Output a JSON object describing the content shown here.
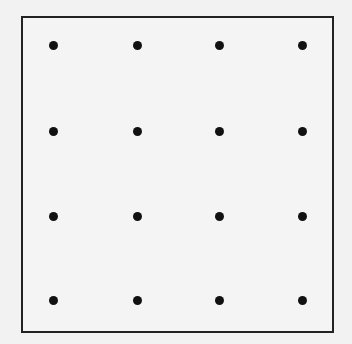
{
  "diagram": {
    "type": "dot-grid",
    "rows": 4,
    "columns": 4,
    "frame": {
      "left": 21,
      "top": 16,
      "width": 313,
      "height": 317,
      "border_color": "#222222"
    },
    "dot_color": "#111111",
    "background_color": "#f2f2f2",
    "column_x": [
      53,
      137,
      219,
      302
    ],
    "row_y": [
      45,
      131,
      216,
      300
    ],
    "dot_count": 16
  }
}
